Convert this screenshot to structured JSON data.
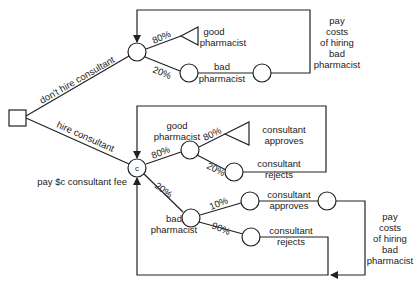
{
  "diagram": {
    "type": "decision-tree",
    "decision_node": {
      "id": "root",
      "shape": "square"
    },
    "branches": {
      "dont_hire": {
        "label": "don't hire consultant"
      },
      "hire": {
        "label": "hire consultant",
        "node_label": "c",
        "fee_label": "pay $c consultant fee"
      }
    },
    "dont_hire_tree": {
      "good": {
        "prob": "80%",
        "label_line1": "good",
        "label_line2": "pharmacist"
      },
      "bad": {
        "prob": "20%",
        "label_line1": "bad",
        "label_line2": "pharmacist"
      },
      "loop_note": [
        "pay",
        "costs",
        "of hiring",
        "bad",
        "pharmacist"
      ]
    },
    "hire_tree": {
      "good": {
        "prob": "80%",
        "label_line1": "good",
        "label_line2": "pharmacist",
        "approves": {
          "prob": "80%",
          "label_line1": "consultant",
          "label_line2": "approves"
        },
        "rejects": {
          "prob": "20%",
          "label_line1": "consultant",
          "label_line2": "rejects"
        }
      },
      "bad": {
        "prob": "20%",
        "label_line1": "bad",
        "label_line2": "pharmacist",
        "approves": {
          "prob": "10%",
          "label_line1": "consultant",
          "label_line2": "approves"
        },
        "rejects": {
          "prob": "90%",
          "label_line1": "consultant",
          "label_line2": "rejects"
        }
      },
      "loop_note": [
        "pay",
        "costs",
        "of hiring",
        "bad",
        "pharmacist"
      ]
    }
  }
}
